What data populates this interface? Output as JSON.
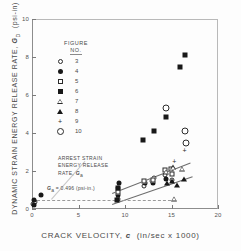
{
  "chart_data": {
    "type": "scatter",
    "title": "",
    "xlabel": "CRACK VELOCITY, c  (in/sec x 1000)",
    "ylabel": "DYNAMIC STRAIN ENERGY RELEASE RATE, Gd (psi-in)",
    "xlim": [
      0,
      20
    ],
    "ylim": [
      0,
      10
    ],
    "xticks": [
      0,
      5,
      10,
      15,
      20
    ],
    "xticklabels": [
      "0",
      "5",
      "10",
      "15",
      "20"
    ],
    "yticks": [
      0,
      2,
      4,
      6,
      8,
      10
    ],
    "yticklabels": [
      "0",
      "2",
      "4",
      "6",
      "8",
      "10"
    ],
    "grid": false,
    "legend_position": "upper-left-inside",
    "legend_title": "FIGURE NO.",
    "series": [
      {
        "name": "3",
        "marker": "open-circle",
        "points": [
          {
            "x": 0.15,
            "y": 0.25
          },
          {
            "x": 0.3,
            "y": 0.35
          },
          {
            "x": 9.2,
            "y": 0.55
          },
          {
            "x": 9.3,
            "y": 1.1
          },
          {
            "x": 12.0,
            "y": 1.2
          },
          {
            "x": 12.9,
            "y": 1.5
          },
          {
            "x": 13.1,
            "y": 1.65
          },
          {
            "x": 14.3,
            "y": 1.8
          },
          {
            "x": 15.0,
            "y": 1.55
          }
        ]
      },
      {
        "name": "4",
        "marker": "filled-circle",
        "points": [
          {
            "x": 0.2,
            "y": 0.2
          },
          {
            "x": 0.25,
            "y": 0.5
          },
          {
            "x": 1.0,
            "y": 0.75
          },
          {
            "x": 9.25,
            "y": 0.75
          },
          {
            "x": 9.35,
            "y": 1.35
          },
          {
            "x": 12.1,
            "y": 1.35
          },
          {
            "x": 13.0,
            "y": 1.35
          },
          {
            "x": 14.4,
            "y": 1.6
          }
        ]
      },
      {
        "name": "5",
        "marker": "open-square",
        "points": [
          {
            "x": 9.2,
            "y": 0.9
          },
          {
            "x": 12.0,
            "y": 1.45
          },
          {
            "x": 13.0,
            "y": 1.55
          },
          {
            "x": 14.3,
            "y": 2.05
          },
          {
            "x": 14.9,
            "y": 2.1
          },
          {
            "x": 15.1,
            "y": 1.85
          }
        ]
      },
      {
        "name": "6",
        "marker": "filled-square",
        "points": [
          {
            "x": 9.1,
            "y": 0.45
          },
          {
            "x": 9.2,
            "y": 1.1
          },
          {
            "x": 11.9,
            "y": 3.65
          },
          {
            "x": 13.1,
            "y": 4.1
          },
          {
            "x": 14.4,
            "y": 4.85
          },
          {
            "x": 15.9,
            "y": 7.5
          },
          {
            "x": 16.5,
            "y": 8.1
          }
        ]
      },
      {
        "name": "7",
        "marker": "open-triangle",
        "points": [
          {
            "x": 14.4,
            "y": 1.95
          },
          {
            "x": 15.2,
            "y": 2.2
          },
          {
            "x": 15.3,
            "y": 0.55
          },
          {
            "x": 16.1,
            "y": 2.1
          }
        ]
      },
      {
        "name": "8",
        "marker": "filled-triangle",
        "points": [
          {
            "x": 14.5,
            "y": 1.35
          },
          {
            "x": 15.1,
            "y": 1.5
          },
          {
            "x": 15.6,
            "y": 1.25
          },
          {
            "x": 16.3,
            "y": 1.6
          }
        ]
      },
      {
        "name": "9",
        "marker": "plus",
        "points": [
          {
            "x": 15.3,
            "y": 2.55
          },
          {
            "x": 16.4,
            "y": 3.1
          }
        ]
      },
      {
        "name": "10",
        "marker": "big-open-circle",
        "points": [
          {
            "x": 14.4,
            "y": 5.3
          },
          {
            "x": 16.5,
            "y": 4.1
          },
          {
            "x": 16.6,
            "y": 3.5
          }
        ]
      }
    ],
    "annotations": [
      {
        "id": "arrest-strain-note",
        "lines": [
          "ARREST STRAIN",
          "ENERGY RELEASE",
          "RATE, Ga"
        ]
      },
      {
        "id": "arrest-equation",
        "text": "Ga = 0.496 (psi-in.)"
      }
    ],
    "trendlines": [
      {
        "id": "upper-trendline",
        "x0": 8.6,
        "y0": 0.85,
        "x1": 17.0,
        "y1": 2.45
      },
      {
        "id": "lower-trendline",
        "x0": 8.6,
        "y0": 0.25,
        "x1": 17.2,
        "y1": 1.7
      }
    ]
  },
  "axes": {
    "x": {
      "label": "CRACK VELOCITY, c  (in/sec x 1000)",
      "label_main": "CRACK VELOCITY,",
      "label_var": "c",
      "label_units": "(in/sec x 1000)"
    },
    "y": {
      "label_main": "DYNAMIC STRAIN ENERGY RELEASE RATE,",
      "label_var": "G",
      "label_var_sub": "D",
      "label_units": "(psi-in)"
    }
  },
  "legend": {
    "title_line1": "FIGURE",
    "title_line2": "NO.",
    "entries": [
      {
        "label": "3",
        "marker": "open-circle"
      },
      {
        "label": "4",
        "marker": "filled-circle"
      },
      {
        "label": "5",
        "marker": "open-square"
      },
      {
        "label": "6",
        "marker": "filled-square"
      },
      {
        "label": "7",
        "marker": "open-triangle"
      },
      {
        "label": "8",
        "marker": "filled-triangle"
      },
      {
        "label": "9",
        "marker": "plus"
      },
      {
        "label": "10",
        "marker": "big-open-circle"
      }
    ]
  },
  "annotations": {
    "arrest_line1": "ARREST STRAIN",
    "arrest_line2": "ENERGY RELEASE",
    "arrest_line3_pre": "RATE,",
    "arrest_line3_var": "G",
    "arrest_line3_sub": "a",
    "equation_var": "G",
    "equation_sub": "a",
    "equation_rest": "= 0.496 (psi-in.)"
  },
  "colors": {
    "marker_fill": "#181818",
    "marker_stroke": "#2b2b2b",
    "axis": "#8d8d8d",
    "text": "#4a4a4a",
    "background": "#fdfdfd"
  }
}
